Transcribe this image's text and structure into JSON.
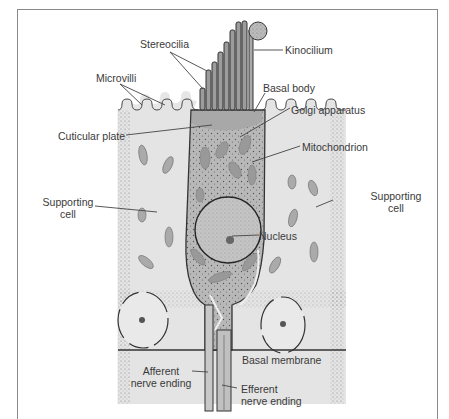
{
  "figure": {
    "labels": {
      "stereocilia": "Stereocilia",
      "kinocilium": "Kinocilium",
      "microvilli": "Microvilli",
      "basal_body": "Basal body",
      "golgi": "Golgi apparatus",
      "cuticular_plate": "Cuticular plate",
      "mitochondrion": "Mitochondrion",
      "supporting_cell_left_1": "Supporting",
      "supporting_cell_left_2": "cell",
      "supporting_cell_right_1": "Supporting",
      "supporting_cell_right_2": "cell",
      "nucleus": "Nucleus",
      "basal_membrane": "Basal membrane",
      "afferent_1": "Afferent",
      "afferent_2": "nerve ending",
      "efferent_1": "Efferent",
      "efferent_2": "nerve ending"
    },
    "colors": {
      "line": "#4a4a4a",
      "hair_cell": "#b8b8b8",
      "supporting_cell": "#e4e4e4",
      "organelle": "#9a9a9a",
      "background": "#ffffff"
    }
  }
}
